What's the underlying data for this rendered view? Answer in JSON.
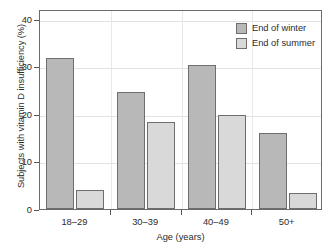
{
  "chart_data": {
    "type": "bar",
    "title": "",
    "xlabel": "Age (years)",
    "ylabel": "Subjects with vitamin D insufficiency (%)",
    "categories": [
      "18–29",
      "30–39",
      "40–49",
      "50+"
    ],
    "series": [
      {
        "name": "End of winter",
        "color": "#b8b8b8",
        "values": [
          31.8,
          24.6,
          30.3,
          15.9
        ]
      },
      {
        "name": "End of summer",
        "color": "#d9d9d9",
        "values": [
          4.0,
          18.3,
          19.7,
          3.4
        ]
      }
    ],
    "ylim": [
      0,
      42
    ],
    "yticks": [
      0,
      10,
      20,
      30,
      40
    ],
    "ytick_labels": [
      "0",
      "10",
      "20",
      "30",
      "40"
    ],
    "grid": "both-faint",
    "legend_position": "top-right-inside",
    "bar_outline_color": "#6e6e6e",
    "frame_color": "#6b6b6b"
  },
  "legend": {
    "items": [
      {
        "label": "End of winter",
        "swatch": "legend-swatch-winter"
      },
      {
        "label": "End of summer",
        "swatch": "legend-swatch-summer"
      }
    ]
  }
}
